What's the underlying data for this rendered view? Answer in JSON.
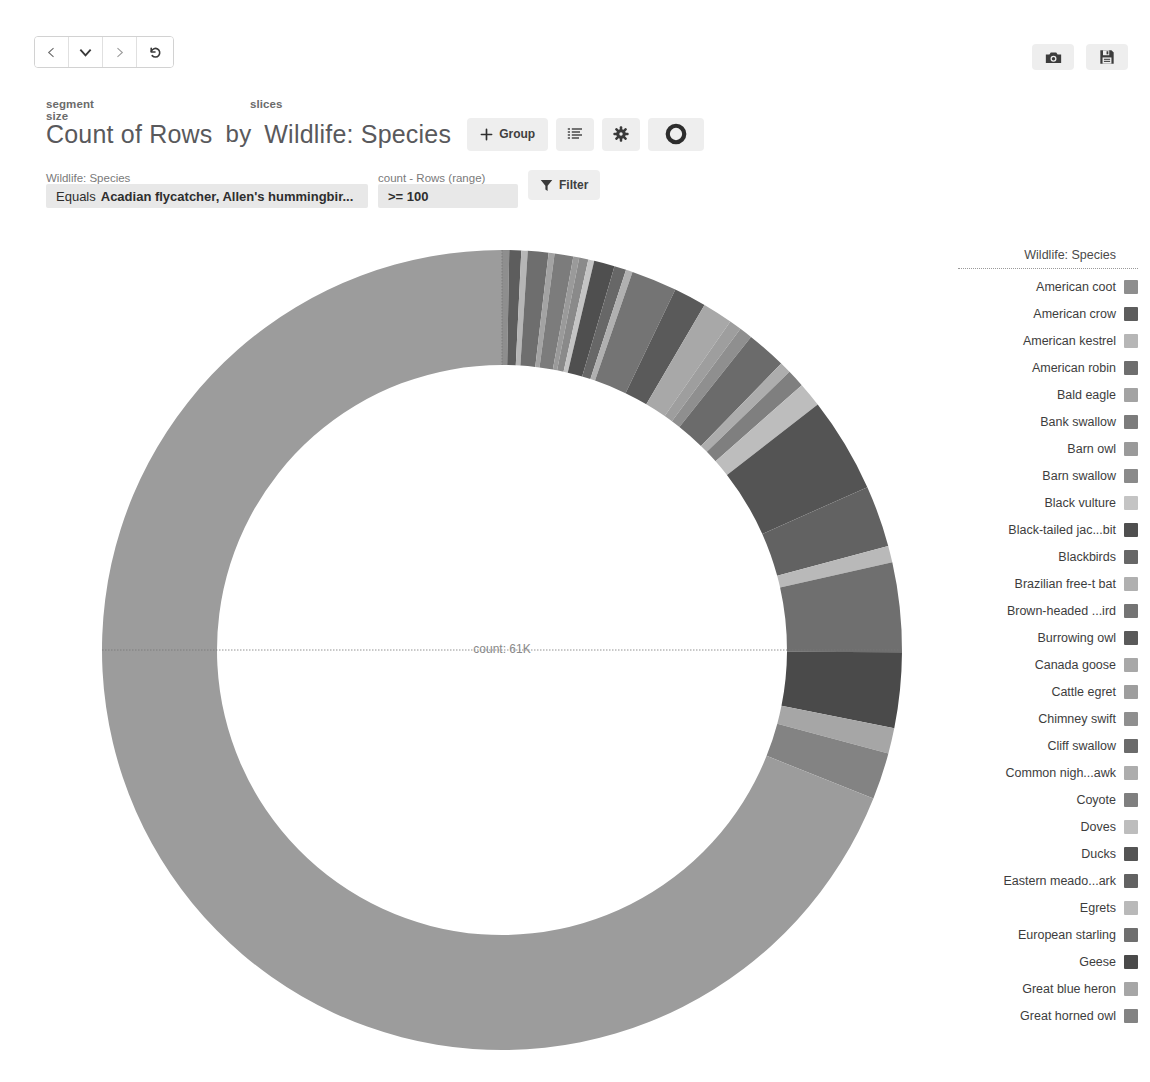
{
  "nav": {
    "back_label": "back",
    "dropdown_label": "history-dropdown",
    "forward_label": "forward",
    "reset_label": "reset"
  },
  "topright": {
    "camera_label": "snapshot",
    "save_label": "save"
  },
  "header": {
    "segment_size_label": "segment size",
    "slices_label": "slices",
    "measure": "Count of Rows",
    "by": "by",
    "dimension": "Wildlife: Species",
    "group_button": "Group",
    "list_button": "list-view",
    "settings_button": "settings",
    "donut_button": "donut-style"
  },
  "filters": {
    "species": {
      "label": "Wildlife: Species",
      "operator": "Equals",
      "value": "Acadian flycatcher, Allen's hummingbir..."
    },
    "count": {
      "label": "count - Rows (range)",
      "value": ">= 100"
    },
    "filter_button": "Filter"
  },
  "chart_center": {
    "text": "count: 61K"
  },
  "legend": {
    "title": "Wildlife: Species"
  },
  "chart_data": {
    "type": "pie",
    "variant": "donut",
    "title": "Count of Rows by Wildlife: Species",
    "measure": "Count of Rows",
    "dimension": "Wildlife: Species",
    "center_label": "count: 61K",
    "total": 61000,
    "legend_position": "right",
    "legend_title": "Wildlife: Species",
    "start_angle_deg": 0,
    "categories": [
      "American coot",
      "American crow",
      "American kestrel",
      "American robin",
      "Bald eagle",
      "Bank swallow",
      "Barn owl",
      "Barn swallow",
      "Black vulture",
      "Black-tailed jac...bit",
      "Blackbirds",
      "Brazilian free-t  bat",
      "Brown-headed ...ird",
      "Burrowing owl",
      "Canada goose",
      "Cattle egret",
      "Chimney swift",
      "Cliff swallow",
      "Common nigh...awk",
      "Coyote",
      "Doves",
      "Ducks",
      "Eastern meado...ark",
      "Egrets",
      "European starling",
      "Geese",
      "Great blue heron",
      "Great horned owl"
    ],
    "values": [
      180,
      300,
      160,
      520,
      150,
      470,
      150,
      230,
      150,
      520,
      300,
      170,
      1150,
      820,
      760,
      310,
      330,
      1000,
      290,
      450,
      620,
      2400,
      1550,
      420,
      2250,
      1900,
      640,
      1180
    ],
    "colors": [
      "#8e8e8e",
      "#5d5d5d",
      "#b6b6b6",
      "#6e6e6e",
      "#a3a3a3",
      "#7c7c7c",
      "#9a9a9a",
      "#8a8a8a",
      "#c4c4c4",
      "#4f4f4f",
      "#676767",
      "#b0b0b0",
      "#747474",
      "#5a5a5a",
      "#a8a8a8",
      "#9e9e9e",
      "#8f8f8f",
      "#6b6b6b",
      "#adadad",
      "#7f7f7f",
      "#bdbdbd",
      "#545454",
      "#626262",
      "#b9b9b9",
      "#6f6f6f",
      "#4a4a4a",
      "#a6a6a6",
      "#838383"
    ],
    "remainder": {
      "label": "Other species",
      "value": 43000,
      "color": "#9c9c9c"
    },
    "xlabel": "",
    "ylabel": "",
    "grid": false
  }
}
